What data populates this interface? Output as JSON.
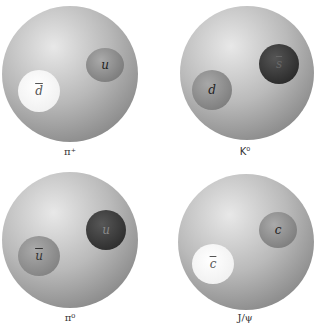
{
  "mesons": [
    {
      "name": "pi-plus",
      "label": "π⁺",
      "quarks": [
        {
          "symbol": "u",
          "anti": false,
          "shade": "medium"
        },
        {
          "symbol": "d",
          "anti": true,
          "shade": "white"
        }
      ]
    },
    {
      "name": "k-zero",
      "label": "K⁰",
      "quarks": [
        {
          "symbol": "d",
          "anti": false,
          "shade": "medium"
        },
        {
          "symbol": "s",
          "anti": true,
          "shade": "dark"
        }
      ]
    },
    {
      "name": "pi-zero",
      "label": "π⁰",
      "quarks": [
        {
          "symbol": "u",
          "anti": false,
          "shade": "dark"
        },
        {
          "symbol": "u",
          "anti": true,
          "shade": "medium"
        }
      ]
    },
    {
      "name": "j-psi",
      "label": "J/ψ",
      "quarks": [
        {
          "symbol": "c",
          "anti": false,
          "shade": "medium"
        },
        {
          "symbol": "c",
          "anti": true,
          "shade": "white"
        }
      ]
    }
  ],
  "colors": {
    "sphere_light": "#e6e6e6",
    "sphere_dark": "#8a8a8a",
    "quark_white": "#f8f8f8",
    "quark_medium": "#8c8c8c",
    "quark_dark": "#2e2e2e"
  }
}
